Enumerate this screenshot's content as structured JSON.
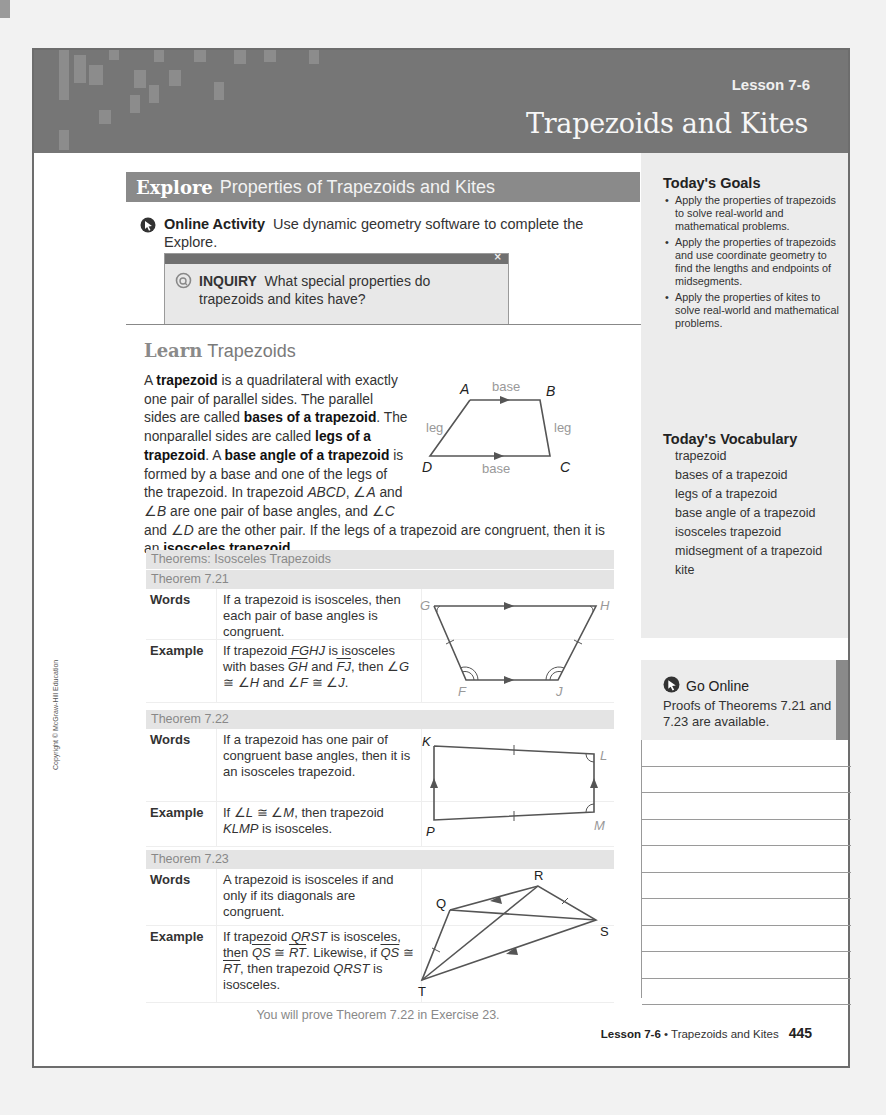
{
  "header": {
    "lesson_number": "Lesson 7-6",
    "title": "Trapezoids and Kites"
  },
  "explore": {
    "keyword": "Explore",
    "title": "Properties of Trapezoids and Kites",
    "online_activity_label": "Online Activity",
    "online_activity_text": "Use dynamic geometry software to complete the Explore.",
    "inquiry_close": "×",
    "inquiry_label": "INQUIRY",
    "inquiry_text": "What special properties do trapezoids and kites have?"
  },
  "learn": {
    "keyword": "Learn",
    "title": "Trapezoids",
    "paragraph": {
      "p1": "A ",
      "b1": "trapezoid",
      "p2": " is a quadrilateral with exactly one pair of parallel sides. The parallel sides are called ",
      "b2": "bases of a trapezoid",
      "p3": ". The nonparallel sides are called ",
      "b3": "legs of a trapezoid",
      "p4": ". A ",
      "b4": "base angle of a trapezoid",
      "p5": " is formed by a base and one of the legs of the trapezoid. In trapezoid ",
      "i1": "ABCD",
      "p6": ", ∠",
      "i2": "A",
      "p7": " and ∠",
      "i3": "B",
      "p8": " are one pair of base angles, and ∠",
      "i4": "C",
      "p9": " and ∠",
      "i5": "D",
      "p10": " are the other pair. If the legs of a trapezoid are congruent, then it is an ",
      "b5": "isosceles trapezoid",
      "p11": "."
    },
    "figure": {
      "labels": {
        "A": "A",
        "B": "B",
        "C": "C",
        "D": "D",
        "base_top": "base",
        "base_bottom": "base",
        "leg_left": "leg",
        "leg_right": "leg"
      }
    }
  },
  "theorems": {
    "title": "Theorems: Isosceles Trapezoids",
    "words_label": "Words",
    "example_label": "Example",
    "t721": {
      "name": "Theorem 7.21",
      "words": "If a trapezoid is isosceles, then each pair of base angles is congruent.",
      "example": {
        "a": "If trapezoid ",
        "b": "FGHJ",
        "c": " is isosceles with bases ",
        "d": "GH",
        "e": " and ",
        "f": "FJ",
        "g": ", then ∠",
        "h": "G",
        "i": " ≅ ∠",
        "j": "H",
        "k": " and ∠",
        "l": "F",
        "m": " ≅ ∠",
        "n": "J",
        "o": "."
      },
      "figure_labels": {
        "G": "G",
        "H": "H",
        "F": "F",
        "J": "J"
      }
    },
    "t722": {
      "name": "Theorem 7.22",
      "words": "If a trapezoid has one pair of congruent base angles, then it is an isosceles trapezoid.",
      "example": {
        "a": "If ∠",
        "b": "L",
        "c": " ≅ ∠",
        "d": "M",
        "e": ", then trapezoid ",
        "f": "KLMP",
        "g": " is isosceles."
      },
      "figure_labels": {
        "K": "K",
        "L": "L",
        "M": "M",
        "P": "P"
      }
    },
    "t723": {
      "name": "Theorem 7.23",
      "words": "A trapezoid is isosceles if and only if its diagonals are congruent.",
      "example": {
        "a": "If trapezoid ",
        "b": "QRST",
        "c": " is isosceles, then ",
        "d": "QS",
        "e": " ≅ ",
        "f": "RT",
        "g": ". Likewise, if ",
        "h": "QS",
        "i": " ≅ ",
        "j": "RT",
        "k": ", then trapezoid ",
        "l": "QRST",
        "m": " is isosceles."
      },
      "figure_labels": {
        "Q": "Q",
        "R": "R",
        "S": "S",
        "T": "T"
      }
    },
    "footnote": "You will prove Theorem 7.22 in Exercise 23."
  },
  "sidebar": {
    "goals_title": "Today's Goals",
    "goals": [
      "Apply the properties of trapezoids to solve real-world and mathematical problems.",
      "Apply the properties of trapezoids and use coordinate geometry to find the lengths and endpoints of midsegments.",
      "Apply the properties of kites to solve real-world and mathematical problems."
    ],
    "vocab_title": "Today's Vocabulary",
    "vocab": [
      "trapezoid",
      "bases of a trapezoid",
      "legs of a trapezoid",
      "base angle of a trapezoid",
      "isosceles trapezoid",
      "midsegment of a trapezoid",
      "kite"
    ],
    "go_online_title": "Go Online",
    "go_online_text": "Proofs of Theorems 7.21 and 7.23 are available."
  },
  "footer": {
    "lesson": "Lesson 7-6",
    "separator": " • ",
    "title": "Trapezoids and Kites",
    "page_number": "445"
  },
  "copyright": "Copyright © McGraw-Hill Education",
  "colors": {
    "banner": "#767676",
    "section_header": "#8a8a8a",
    "sidebar_bg": "#ececec",
    "theorem_header_bg": "#e4e4e4"
  }
}
